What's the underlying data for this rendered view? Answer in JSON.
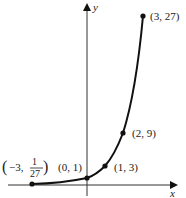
{
  "figure": {
    "function": "y = 3^x",
    "axes": {
      "x_label": "x",
      "y_label": "y"
    },
    "points": [
      {
        "label_prefix": "(−3, ",
        "num": "1",
        "den": "27",
        "label_suffix": ")",
        "x": -3,
        "y": 0.037
      },
      {
        "label": "(0, 1)",
        "x": 0,
        "y": 1
      },
      {
        "label": "(1, 3)",
        "x": 1,
        "y": 3
      },
      {
        "label": "(2, 9)",
        "x": 2,
        "y": 9
      },
      {
        "label": "(3, 27)",
        "x": 3,
        "y": 27
      }
    ],
    "colors": {
      "stroke": "#111111",
      "text": "#222222"
    }
  }
}
